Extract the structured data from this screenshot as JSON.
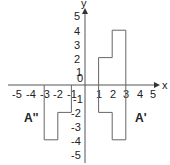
{
  "diagram": {
    "type": "coordinate-plane-transformations",
    "axes": {
      "x_label": "x",
      "y_label": "y",
      "origin_label": "0",
      "x_ticks": [
        "-5",
        "-4",
        "-3",
        "-2",
        "-1",
        "1",
        "2",
        "3",
        "4",
        "5"
      ],
      "y_ticks_positive": [
        "5",
        "4",
        "3",
        "2",
        "1"
      ],
      "y_ticks_negative": [
        "-1",
        "-2",
        "-3",
        "-4",
        "-5"
      ],
      "range": {
        "x": [
          -5,
          5
        ],
        "y": [
          -5,
          5
        ]
      }
    },
    "shapes": [
      {
        "name": "A",
        "label": "",
        "points": [
          [
            1,
            0
          ],
          [
            1,
            2
          ],
          [
            2,
            2
          ],
          [
            2,
            4
          ],
          [
            3,
            4
          ],
          [
            3,
            0
          ]
        ]
      },
      {
        "name": "A'",
        "label": "A'",
        "points": [
          [
            1,
            0
          ],
          [
            1,
            -2
          ],
          [
            2,
            -2
          ],
          [
            2,
            -4
          ],
          [
            3,
            -4
          ],
          [
            3,
            0
          ]
        ]
      },
      {
        "name": "A''",
        "label": "A''",
        "points": [
          [
            -1,
            0
          ],
          [
            -1,
            -2
          ],
          [
            -2,
            -2
          ],
          [
            -2,
            -4
          ],
          [
            -3,
            -4
          ],
          [
            -3,
            0
          ]
        ]
      }
    ],
    "colors": {
      "line": "#666666",
      "axis": "#333333",
      "text": "#222222"
    }
  }
}
